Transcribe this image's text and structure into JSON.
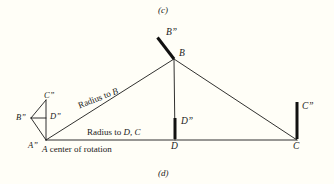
{
  "figure": {
    "caption_top": "(c)",
    "caption_bottom": "(d)",
    "background_color": "#fffef7",
    "ink_color": "#1a1a18"
  },
  "labels": {
    "vertex_A": "A",
    "vertex_B": "B",
    "vertex_C": "C",
    "vertex_D": "D",
    "vertex_A_rotated": "A”",
    "vertex_B_rotated_small": "B”",
    "vertex_C_rotated_small": "C”",
    "vertex_D_rotated_small": "D”",
    "vertex_B_rotated_main": "B”",
    "vertex_C_rotated_main": "C”",
    "vertex_D_rotated_main": "D”"
  },
  "annotations": {
    "radius_to_b": "Radius to B",
    "radius_to_b_plain": "Radius to ",
    "radius_to_b_italic": "B",
    "radius_to_dc_plain": "Radius to ",
    "radius_to_dc_italic": "D, C",
    "center_of_rotation_italic": "A",
    "center_of_rotation_plain": " center of rotation"
  },
  "geometry": {
    "points": {
      "A": [
        46,
        140
      ],
      "B": [
        174,
        59
      ],
      "C": [
        297,
        140
      ],
      "D": [
        175,
        140
      ]
    },
    "rotated_marks": {
      "B_double_prime_line": [
        [
          174,
          59
        ],
        [
          157,
          37
        ]
      ],
      "D_double_prime_line": [
        [
          175,
          140
        ],
        [
          175,
          118
        ]
      ],
      "C_double_prime_line": [
        [
          297,
          140
        ],
        [
          297,
          102
        ]
      ],
      "small_A": [
        46,
        140
      ],
      "small_B": [
        31,
        118
      ],
      "small_C": [
        46,
        100
      ],
      "small_D_mid": [
        46,
        118
      ]
    },
    "thin_stroke_width": 0.9,
    "thick_stroke_width": 3.0
  }
}
